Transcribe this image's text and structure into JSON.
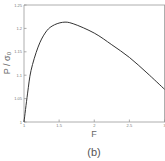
{
  "chart_data": {
    "type": "line",
    "title": "",
    "panel_label": "(b)",
    "xlabel": "F",
    "ylabel": "P / σ₀",
    "xlim": [
      1,
      3
    ],
    "ylim": [
      1,
      1.25
    ],
    "x_ticks": [
      "1",
      "1.5",
      "2",
      "2.5",
      "3"
    ],
    "y_ticks": [
      "1",
      "1.05",
      "1.1",
      "1.15",
      "1.2",
      "1.25"
    ],
    "grid": false,
    "legend": null,
    "series": [
      {
        "name": "P/σ0 vs F",
        "x": [
          1.0,
          1.05,
          1.1,
          1.2,
          1.3,
          1.4,
          1.55,
          1.7,
          2.0,
          2.25,
          2.5,
          2.75,
          3.0
        ],
        "y": [
          1.0,
          1.06,
          1.11,
          1.16,
          1.19,
          1.205,
          1.213,
          1.21,
          1.19,
          1.165,
          1.138,
          1.105,
          1.07
        ]
      }
    ],
    "colors": {
      "curve": "#333333",
      "axes": "#888888"
    }
  }
}
